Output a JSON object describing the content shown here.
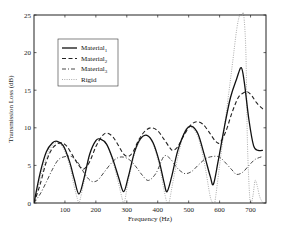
{
  "chart_data": {
    "type": "line",
    "title": "",
    "xlabel": "Frequency (Hz)",
    "ylabel": "Transmission Loss (dB)",
    "xlim": [
      0,
      750
    ],
    "ylim": [
      0,
      25
    ],
    "x_ticks": [
      100,
      200,
      300,
      400,
      500,
      600,
      700
    ],
    "y_ticks": [
      0,
      5,
      10,
      15,
      20,
      25
    ],
    "grid": false,
    "legend_position": "upper-left",
    "series": [
      {
        "name": "Material1",
        "style": "solid",
        "x": [
          0,
          20,
          40,
          60,
          75,
          95,
          115,
          130,
          145,
          160,
          180,
          200,
          215,
          235,
          255,
          275,
          290,
          305,
          325,
          345,
          365,
          385,
          405,
          420,
          430,
          445,
          465,
          490,
          510,
          530,
          550,
          570,
          580,
          595,
          615,
          635,
          655,
          670,
          680,
          695,
          710,
          725,
          740
        ],
        "y": [
          0,
          4.0,
          6.8,
          8.0,
          8.2,
          7.6,
          5.5,
          3.2,
          1.2,
          3.0,
          6.5,
          8.3,
          8.5,
          7.8,
          5.8,
          3.2,
          1.5,
          3.5,
          6.8,
          8.6,
          9.0,
          8.0,
          5.5,
          2.8,
          1.5,
          3.5,
          7.0,
          9.6,
          10.2,
          9.2,
          6.5,
          3.5,
          2.5,
          5.5,
          10.0,
          14.0,
          16.5,
          18.0,
          16.0,
          11.0,
          7.6,
          7.0,
          7.0
        ]
      },
      {
        "name": "Material2",
        "style": "dashed",
        "x": [
          0,
          20,
          40,
          60,
          85,
          105,
          125,
          145,
          160,
          180,
          200,
          220,
          235,
          255,
          275,
          290,
          305,
          320,
          340,
          360,
          380,
          400,
          420,
          440,
          450,
          465,
          485,
          505,
          525,
          545,
          565,
          585,
          600,
          620,
          640,
          660,
          675,
          690,
          705,
          720,
          740
        ],
        "y": [
          0,
          2.5,
          5.5,
          7.3,
          8.0,
          7.6,
          6.3,
          5.0,
          4.5,
          5.5,
          7.5,
          8.9,
          9.3,
          8.8,
          7.5,
          6.5,
          6.2,
          6.8,
          8.5,
          9.6,
          10.0,
          9.6,
          8.5,
          7.3,
          7.0,
          7.5,
          9.0,
          10.3,
          10.8,
          10.5,
          9.5,
          8.3,
          8.0,
          9.5,
          12.0,
          14.0,
          14.6,
          14.8,
          14.2,
          13.3,
          12.5
        ]
      },
      {
        "name": "Material3",
        "style": "dash-dot",
        "x": [
          0,
          20,
          40,
          60,
          80,
          105,
          125,
          145,
          165,
          185,
          205,
          225,
          250,
          270,
          290,
          310,
          330,
          350,
          370,
          395,
          420,
          440,
          460,
          475,
          490,
          510,
          530,
          555,
          580,
          600,
          620,
          640,
          655,
          675,
          695,
          715,
          740
        ],
        "y": [
          0,
          1.2,
          2.8,
          4.5,
          5.8,
          6.2,
          6.1,
          5.2,
          3.8,
          2.9,
          3.0,
          4.0,
          5.3,
          6.0,
          6.1,
          5.7,
          4.8,
          3.7,
          3.0,
          4.0,
          6.2,
          5.9,
          4.8,
          4.2,
          3.9,
          4.2,
          5.0,
          5.9,
          6.2,
          6.1,
          5.3,
          4.4,
          3.8,
          4.1,
          5.0,
          5.8,
          6.2
        ]
      },
      {
        "name": "Rigid",
        "style": "dotted",
        "x": [
          0,
          20,
          40,
          60,
          75,
          95,
          115,
          130,
          140,
          145,
          150,
          160,
          180,
          200,
          215,
          235,
          255,
          275,
          285,
          290,
          295,
          305,
          325,
          345,
          365,
          385,
          405,
          420,
          428,
          433,
          438,
          450,
          470,
          490,
          510,
          530,
          550,
          568,
          575,
          580,
          585,
          600,
          620,
          640,
          655,
          665,
          672,
          678,
          685,
          690,
          697,
          702,
          708,
          715,
          722,
          730,
          740
        ],
        "y": [
          0,
          3.2,
          6.0,
          7.7,
          8.0,
          7.3,
          5.0,
          2.2,
          0.6,
          0,
          0.6,
          2.5,
          6.3,
          8.2,
          8.5,
          7.8,
          5.5,
          2.3,
          0.6,
          0,
          0.6,
          3.0,
          6.5,
          8.5,
          9.0,
          7.8,
          5.0,
          1.8,
          0.3,
          0,
          0.3,
          3.0,
          7.0,
          9.8,
          10.0,
          8.8,
          5.5,
          1.2,
          0.2,
          0,
          0.2,
          5.0,
          11.5,
          18.0,
          23.0,
          25.0,
          25.0,
          25.0,
          20.0,
          8.0,
          1.0,
          0,
          1.0,
          3.0,
          2.2,
          0.8,
          0
        ]
      }
    ]
  },
  "axes": {
    "xlabel": "Frequency (Hz)",
    "ylabel": "Transmission Loss (dB)",
    "x_tick_labels": [
      "100",
      "200",
      "300",
      "400",
      "500",
      "600",
      "700"
    ],
    "y_tick_labels": [
      "0",
      "5",
      "10",
      "15",
      "20",
      "25"
    ]
  },
  "legend": {
    "items": [
      {
        "label": "Material",
        "sub": "1",
        "style": "solid"
      },
      {
        "label": "Material",
        "sub": "2",
        "style": "dashed"
      },
      {
        "label": "Material",
        "sub": "3",
        "style": "dash-dot"
      },
      {
        "label": "Rigid",
        "sub": "",
        "style": "dotted"
      }
    ]
  }
}
